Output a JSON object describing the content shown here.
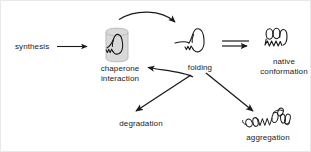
{
  "diagram": {
    "background_color": "#ffffff",
    "stroke_color": "#1a1a1a",
    "chaperone_fill_color": "#d9d9d9",
    "labels": {
      "synthesis": "synthesis",
      "chaperone_interaction_line1": "chaperone",
      "chaperone_interaction_line2": "interaction",
      "folding": "folding",
      "native_line1": "native",
      "native_line2": "conformation",
      "degradation": "degradation",
      "aggregation": "aggregation"
    },
    "shapes": {
      "chaperone_barrel": "chaperone-barrel-icon",
      "unfolded_protein": "unfolded-protein-icon",
      "folding_intermediate": "folding-intermediate-icon",
      "native_protein": "native-protein-icon",
      "aggregate": "protein-aggregate-icon"
    },
    "arrows": {
      "synthesis_to_chaperone": "straight-arrow",
      "chaperone_to_folding": "curved-arrow-top",
      "folding_to_chaperone": "curved-arrow-bottom",
      "folding_to_native": "double-arrow",
      "folding_to_degradation": "straight-arrow",
      "folding_to_aggregation": "straight-arrow"
    }
  }
}
